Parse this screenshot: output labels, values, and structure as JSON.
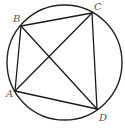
{
  "diagram": {
    "type": "cyclic-quadrilateral",
    "circle": {
      "cx": 64.5,
      "cy": 62.5,
      "r": 57.5
    },
    "points": {
      "A": {
        "x": 15,
        "y": 91,
        "label": "A",
        "label_x": 6,
        "label_y": 97
      },
      "B": {
        "x": 21,
        "y": 26,
        "label": "B",
        "label_x": 13,
        "label_y": 22
      },
      "C": {
        "x": 92,
        "y": 13,
        "label": "C",
        "label_x": 94,
        "label_y": 10
      },
      "D": {
        "x": 97,
        "y": 109,
        "label": "D",
        "label_x": 99,
        "label_y": 121
      }
    },
    "segments": [
      {
        "from": "A",
        "to": "B",
        "kind": "side"
      },
      {
        "from": "B",
        "to": "C",
        "kind": "side"
      },
      {
        "from": "C",
        "to": "D",
        "kind": "side"
      },
      {
        "from": "D",
        "to": "A",
        "kind": "side"
      },
      {
        "from": "A",
        "to": "C",
        "kind": "diagonal"
      },
      {
        "from": "B",
        "to": "D",
        "kind": "diagonal"
      }
    ],
    "colors": {
      "line": "#1a1a1a",
      "label": "#555555",
      "background": "#ffffff"
    }
  }
}
